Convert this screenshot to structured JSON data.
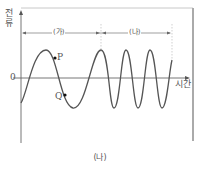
{
  "figure": {
    "caption": "(나)",
    "y_axis_label": "전류",
    "x_axis_label": "시간",
    "origin_label": "0",
    "segments": [
      {
        "label": "(가)",
        "description": "lower frequency region"
      },
      {
        "label": "(나)",
        "description": "higher frequency region"
      }
    ],
    "points": [
      {
        "label": "P",
        "location": "on descending slope after first peak, above zero"
      },
      {
        "label": "Q",
        "location": "on descending slope below zero, before first trough"
      }
    ],
    "colors": {
      "curve": "#555555",
      "axis": "#555555",
      "frame": "#aaaaaa",
      "guide": "#bbbbbb"
    }
  },
  "chart_data": {
    "type": "line",
    "title": "",
    "xlabel": "시간",
    "ylabel": "전류",
    "regions": [
      {
        "label": "(가)",
        "x_range": [
          0,
          0.45
        ],
        "cycles": 1.25
      },
      {
        "label": "(나)",
        "x_range": [
          0.45,
          0.86
        ],
        "cycles": 2.9
      }
    ],
    "annotations": [
      "P",
      "Q"
    ],
    "grid": false
  }
}
